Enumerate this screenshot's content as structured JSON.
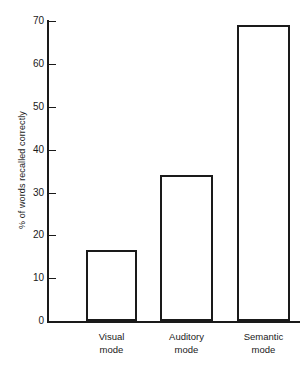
{
  "chart_data": {
    "type": "bar",
    "title": "",
    "subtitle": "",
    "xlabel": "",
    "ylabel": "% of words recalled correctly",
    "categories": [
      "Visual mode",
      "Auditory mode",
      "Semantic mode"
    ],
    "category_lines": [
      [
        "Visual",
        "mode"
      ],
      [
        "Auditory",
        "mode"
      ],
      [
        "Semantic",
        "mode"
      ]
    ],
    "values": [
      16.5,
      34,
      69
    ],
    "ylim": [
      0,
      73
    ],
    "yticks": [
      0,
      10,
      20,
      30,
      40,
      50,
      60,
      70
    ],
    "ytick_labels": [
      "0",
      "10",
      "20",
      "30",
      "40",
      "50",
      "60",
      "70"
    ],
    "grid": false,
    "legend": false,
    "legend_position": "none",
    "bar_fill_color": "#ffffff",
    "bar_edge_color": "#1a1a1a",
    "axis_color": "#1a1a1a",
    "background_color": "#ffffff"
  }
}
